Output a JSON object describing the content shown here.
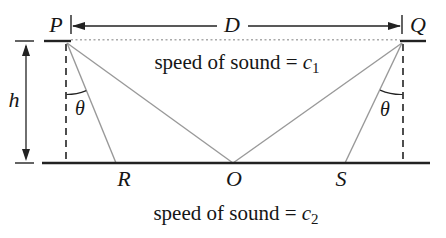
{
  "figure": {
    "point_labels": {
      "p": "P",
      "q": "Q",
      "r": "R",
      "o": "O",
      "s": "S"
    },
    "dimension_labels": {
      "d": "D",
      "h": "h",
      "theta_left": "θ",
      "theta_right": "θ"
    },
    "layer1_label": {
      "prefix": "speed of sound = ",
      "symbol": "c",
      "subscript": "1"
    },
    "layer2_label": {
      "prefix": "speed of sound = ",
      "symbol": "c",
      "subscript": "2"
    },
    "colors": {
      "ink": "#222222",
      "ray": "#999999",
      "dotted_interface": "#aaaaaa",
      "background": "#ffffff"
    }
  }
}
